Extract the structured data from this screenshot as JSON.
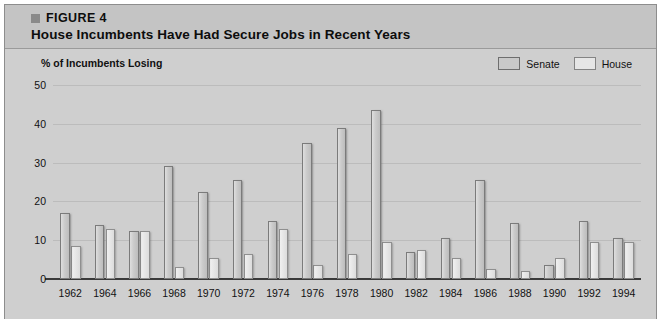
{
  "figure": {
    "label": "FIGURE 4",
    "title": "House Incumbents Have Had Secure Jobs in Recent Years"
  },
  "colors": {
    "card_background": "#cfcfcf",
    "header_background": "#c4c4c4",
    "senate_bar": "#cbcbcb",
    "house_bar": "#e6e6e6",
    "gridline": "#bcbcbc",
    "axis": "#3a3a3a"
  },
  "legend": {
    "position": "top-right",
    "items": [
      {
        "label": "Senate",
        "swatch": "senate"
      },
      {
        "label": "House",
        "swatch": "house"
      }
    ]
  },
  "chart_data": {
    "type": "bar",
    "title": "House Incumbents Have Had Secure Jobs in Recent Years",
    "subtitle": "FIGURE 4",
    "xlabel": "",
    "ylabel": "% of Incumbents Losing",
    "ylim": [
      0,
      50
    ],
    "yticks": [
      0,
      10,
      20,
      30,
      40,
      50
    ],
    "grid": true,
    "legend_position": "top-right",
    "categories": [
      "1962",
      "1964",
      "1966",
      "1968",
      "1970",
      "1972",
      "1974",
      "1976",
      "1978",
      "1980",
      "1982",
      "1984",
      "1986",
      "1988",
      "1990",
      "1992",
      "1994"
    ],
    "series": [
      {
        "name": "Senate",
        "values": [
          17,
          14,
          12.5,
          29,
          22.5,
          25.5,
          15,
          35,
          39,
          43.5,
          7,
          10.5,
          25.5,
          14.5,
          3.5,
          15,
          10.5
        ]
      },
      {
        "name": "House",
        "values": [
          8.5,
          13,
          12.5,
          3,
          5.5,
          6.5,
          13,
          3.5,
          6.5,
          9.5,
          7.5,
          5.5,
          2.5,
          2,
          5.5,
          9.5,
          9.5
        ]
      }
    ]
  }
}
